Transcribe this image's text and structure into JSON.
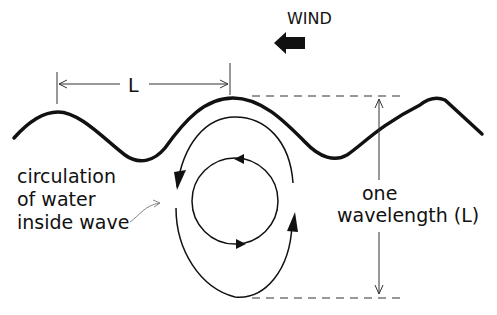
{
  "diagram": {
    "labels": {
      "wind": "WIND",
      "length_marker": "L",
      "circulation_line1": "circulation",
      "circulation_line2": "of water",
      "circulation_line3": "inside wave",
      "depth_line1": "one",
      "depth_line2": "wavelength (L)"
    },
    "elements": {
      "wave_surface": "sinusoidal water surface with crests and troughs",
      "wind_arrow": "solid arrow pointing left (wind direction)",
      "wavelength_dimension": "horizontal dimension line between two crests labeled L",
      "outer_orbit": "large oval circulation path with arrowheads",
      "inner_orbit": "small circular circulation path with arrowheads",
      "depth_dimension": "vertical double arrow between dashed lines at crest level and one wavelength below"
    },
    "colors": {
      "ink": "#111111",
      "background": "#ffffff"
    }
  }
}
